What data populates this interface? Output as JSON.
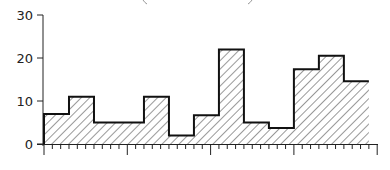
{
  "chart_data": {
    "type": "bar",
    "style": "step-histogram with diagonal hatch fill",
    "title": "",
    "xlabel": "",
    "ylabel": "",
    "ylim": [
      0,
      30
    ],
    "yticks": [
      0,
      10,
      20,
      30
    ],
    "ytick_labels": [
      "0",
      "10",
      "20",
      "30"
    ],
    "x_minor_ticks": 40,
    "x_major_tick_every": 10,
    "grid": false,
    "legend": null,
    "bin_width_ticks": 3,
    "bins": [
      {
        "start_tick": 0,
        "end_tick": 3,
        "value": 7
      },
      {
        "start_tick": 3,
        "end_tick": 6,
        "value": 11
      },
      {
        "start_tick": 6,
        "end_tick": 12,
        "value": 5
      },
      {
        "start_tick": 12,
        "end_tick": 15,
        "value": 11
      },
      {
        "start_tick": 15,
        "end_tick": 18,
        "value": 2
      },
      {
        "start_tick": 18,
        "end_tick": 21,
        "value": 6.7
      },
      {
        "start_tick": 21,
        "end_tick": 24,
        "value": 22
      },
      {
        "start_tick": 24,
        "end_tick": 27,
        "value": 5
      },
      {
        "start_tick": 27,
        "end_tick": 30,
        "value": 3.7
      },
      {
        "start_tick": 30,
        "end_tick": 33,
        "value": 17.4
      },
      {
        "start_tick": 33,
        "end_tick": 36,
        "value": 20.5
      },
      {
        "start_tick": 36,
        "end_tick": 39,
        "value": 14.6
      }
    ],
    "categories": [
      "1",
      "2",
      "3",
      "4",
      "5",
      "6",
      "7",
      "8",
      "9",
      "10",
      "11",
      "12",
      "13"
    ],
    "values": [
      7,
      11,
      5,
      5,
      11,
      2,
      6.7,
      22,
      5,
      3.7,
      17.4,
      20.5,
      14.6
    ]
  },
  "colors": {
    "line": "#111111",
    "hatch": "#333333",
    "background": "#ffffff"
  }
}
